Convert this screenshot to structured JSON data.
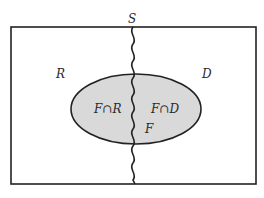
{
  "diagram": {
    "sample_space_label": "S",
    "region_left_label": "R",
    "region_right_label": "D",
    "event_label": "F",
    "intersection_left_label": "F∩R",
    "intersection_right_label": "F∩D",
    "colors": {
      "stroke": "#222222",
      "event_fill": "#d9d9d9",
      "background": "#ffffff"
    }
  }
}
